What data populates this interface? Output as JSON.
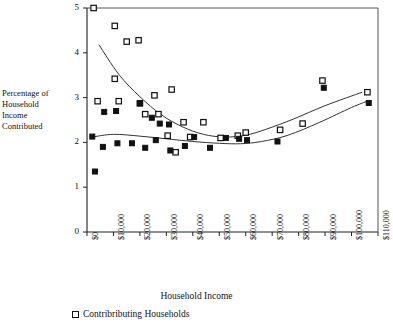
{
  "chart_data": {
    "type": "scatter",
    "title": "",
    "xlabel": "Household Income",
    "ylabel": "Percentage of Household Income Contributed",
    "ylabel_lines": [
      "Percentage of",
      "Household",
      "Income",
      "Contributed"
    ],
    "xlim": [
      0,
      110000
    ],
    "ylim": [
      0,
      5
    ],
    "grid": false,
    "legend_position": "bottom-left",
    "ytick_labels": [
      "0",
      "1",
      "2",
      "3",
      "4",
      "5"
    ],
    "ytick_values": [
      0,
      1,
      2,
      3,
      4,
      5
    ],
    "xtick_labels": [
      "$0",
      "$10,000",
      "$20,000",
      "$30,000",
      "$40,000",
      "$50,000",
      "$60,000",
      "$70,000",
      "$80,000",
      "$90,000",
      "$100,000",
      "$110,000"
    ],
    "xtick_values": [
      0,
      10000,
      20000,
      30000,
      40000,
      50000,
      60000,
      70000,
      80000,
      90000,
      100000,
      110000
    ],
    "series": [
      {
        "name": "Contribributing Households",
        "marker": "open-square",
        "points": [
          [
            2500,
            5.0
          ],
          [
            10500,
            4.6
          ],
          [
            15000,
            4.25
          ],
          [
            19500,
            4.28
          ],
          [
            10500,
            3.42
          ],
          [
            4000,
            2.92
          ],
          [
            12000,
            2.92
          ],
          [
            20000,
            2.87
          ],
          [
            25500,
            3.05
          ],
          [
            22000,
            2.63
          ],
          [
            27000,
            2.63
          ],
          [
            32000,
            3.18
          ],
          [
            36500,
            2.45
          ],
          [
            44000,
            2.45
          ],
          [
            30500,
            2.15
          ],
          [
            39000,
            2.12
          ],
          [
            50500,
            2.1
          ],
          [
            57000,
            2.15
          ],
          [
            60000,
            2.22
          ],
          [
            73000,
            2.28
          ],
          [
            81500,
            2.42
          ],
          [
            89000,
            3.38
          ],
          [
            106000,
            3.12
          ],
          [
            33500,
            1.78
          ]
        ]
      },
      {
        "name": "Noncontributing Households",
        "marker": "filled-square",
        "points": [
          [
            2000,
            2.13
          ],
          [
            6500,
            2.68
          ],
          [
            11000,
            2.7
          ],
          [
            20000,
            2.88
          ],
          [
            24500,
            2.55
          ],
          [
            27500,
            2.42
          ],
          [
            31000,
            2.4
          ],
          [
            6000,
            1.9
          ],
          [
            11500,
            1.98
          ],
          [
            17000,
            1.98
          ],
          [
            22000,
            1.88
          ],
          [
            26000,
            2.05
          ],
          [
            31500,
            1.82
          ],
          [
            37000,
            1.92
          ],
          [
            40500,
            2.12
          ],
          [
            46500,
            1.88
          ],
          [
            52500,
            2.1
          ],
          [
            57500,
            2.08
          ],
          [
            60500,
            2.05
          ],
          [
            72000,
            2.02
          ],
          [
            89500,
            3.22
          ],
          [
            106500,
            2.88
          ],
          [
            3000,
            1.35
          ]
        ]
      }
    ],
    "fit_curves": [
      {
        "for_series": "Contribributing Households",
        "points": [
          [
            4500,
            4.18
          ],
          [
            12000,
            3.52
          ],
          [
            20000,
            3.02
          ],
          [
            28000,
            2.62
          ],
          [
            36000,
            2.35
          ],
          [
            44000,
            2.18
          ],
          [
            52000,
            2.12
          ],
          [
            60000,
            2.16
          ],
          [
            68000,
            2.3
          ],
          [
            78000,
            2.52
          ],
          [
            90000,
            2.82
          ],
          [
            104000,
            3.12
          ]
        ]
      },
      {
        "for_series": "Noncontributing Households",
        "points": [
          [
            2000,
            2.12
          ],
          [
            10000,
            2.18
          ],
          [
            20000,
            2.14
          ],
          [
            30000,
            2.08
          ],
          [
            40000,
            2.02
          ],
          [
            50000,
            1.98
          ],
          [
            58000,
            1.97
          ],
          [
            66000,
            2.02
          ],
          [
            76000,
            2.16
          ],
          [
            88000,
            2.45
          ],
          [
            100000,
            2.78
          ],
          [
            106000,
            2.92
          ]
        ]
      }
    ]
  },
  "legend": {
    "entries": [
      {
        "label": "Contribributing Households",
        "marker": "open-square"
      }
    ]
  }
}
